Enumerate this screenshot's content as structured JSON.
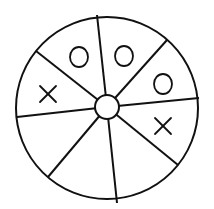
{
  "diagram": {
    "type": "spinner-wheel",
    "sectors": 8,
    "colors": {
      "stroke": "#111111",
      "fill": "#ffffff"
    },
    "outer_circle": {
      "cx": 107,
      "cy": 108,
      "r": 91
    },
    "hub": {
      "cx": 107,
      "cy": 107,
      "r": 12
    },
    "spokes": [
      {
        "x": 97,
        "y": 15
      },
      {
        "x": 167,
        "y": 40
      },
      {
        "x": 199,
        "y": 98
      },
      {
        "x": 178,
        "y": 165
      },
      {
        "x": 117,
        "y": 203
      },
      {
        "x": 48,
        "y": 177
      },
      {
        "x": 17,
        "y": 117
      },
      {
        "x": 36,
        "y": 51
      }
    ],
    "marks": [
      {
        "symbol": "O",
        "sector": "upper-left-top",
        "x": 79,
        "y": 57
      },
      {
        "symbol": "O",
        "sector": "top-right",
        "x": 124,
        "y": 56
      },
      {
        "symbol": "O",
        "sector": "right-upper",
        "x": 163,
        "y": 84
      },
      {
        "symbol": "X",
        "sector": "right-lower",
        "x": 163,
        "y": 126
      },
      {
        "symbol": "X",
        "sector": "left-upper",
        "x": 48,
        "y": 94
      }
    ]
  }
}
